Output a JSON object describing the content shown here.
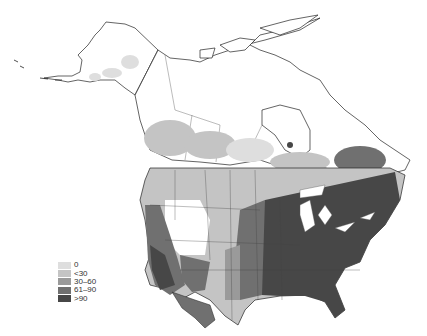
{
  "map": {
    "subject": "North America choropleth",
    "colors": {
      "background": "#ffffff",
      "outline": "#222222",
      "border": "#555555"
    }
  },
  "legend": {
    "items": [
      {
        "label": "0",
        "color": "#dedede"
      },
      {
        "label": "<30",
        "color": "#c4c4c4"
      },
      {
        "label": "30–60",
        "color": "#9a9a9a"
      },
      {
        "label": "61–90",
        "color": "#707070"
      },
      {
        "label": ">90",
        "color": "#474747"
      }
    ]
  }
}
